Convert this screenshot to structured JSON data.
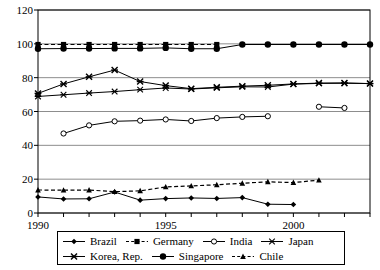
{
  "chart_data": {
    "type": "line",
    "title": "",
    "xlabel": "",
    "ylabel": "",
    "xlim": [
      1990,
      2003
    ],
    "ylim": [
      0,
      120
    ],
    "ytick_step": 20,
    "yticks": [
      0,
      20,
      40,
      60,
      80,
      100,
      120
    ],
    "xticks_labeled": [
      1990,
      1995,
      2000
    ],
    "xticks_all": [
      1990,
      1991,
      1992,
      1993,
      1994,
      1995,
      1996,
      1997,
      1998,
      1999,
      2000,
      2001,
      2002,
      2003
    ],
    "grid": "horizontal",
    "legend_position": "bottom",
    "series": [
      {
        "name": "Brazil",
        "marker": "diamond-filled",
        "line": "solid",
        "x": [
          1990,
          1991,
          1992,
          1993,
          1994,
          1995,
          1996,
          1997,
          1998,
          1999,
          2000
        ],
        "values": [
          9.5,
          8.3,
          8.4,
          12.4,
          7.6,
          8.5,
          8.9,
          8.6,
          9.1,
          5.2,
          5.0
        ]
      },
      {
        "name": "Germany",
        "marker": "square-filled",
        "line": "dashed",
        "x": [
          1990,
          1991,
          1992,
          1993,
          1994,
          1995,
          1996,
          1997
        ],
        "values": [
          99.6,
          99.6,
          99.6,
          99.6,
          99.6,
          99.6,
          99.6,
          99.6
        ]
      },
      {
        "name": "India",
        "marker": "circle-open",
        "line": "solid",
        "x": [
          1991,
          1992,
          1993,
          1994,
          1995,
          1996,
          1997,
          1998,
          1999,
          2001,
          2002
        ],
        "values": [
          47.0,
          51.8,
          54.2,
          54.6,
          55.3,
          54.4,
          56.1,
          56.8,
          57.2,
          62.8,
          62.1
        ]
      },
      {
        "name": "Japan",
        "marker": "x",
        "line": "solid",
        "x": [
          1990,
          1991,
          1992,
          1993,
          1994,
          1995,
          1996,
          1997,
          1998,
          1999,
          2000,
          2001,
          2002,
          2003
        ],
        "values": [
          68.9,
          69.9,
          70.9,
          71.8,
          72.9,
          73.9,
          73.3,
          74.0,
          74.6,
          74.5,
          76.2,
          76.6,
          76.7,
          76.5
        ]
      },
      {
        "name": "Korea, Rep.",
        "marker": "x-bold",
        "line": "solid",
        "x": [
          1990,
          1991,
          1992,
          1993,
          1994,
          1995,
          1996,
          1997,
          1998,
          1999,
          2000,
          2001,
          2002,
          2003
        ],
        "values": [
          70.7,
          76.3,
          80.5,
          84.5,
          77.7,
          75.3,
          73.5,
          74.3,
          75.0,
          75.5,
          76.3,
          76.8,
          76.9,
          76.5
        ]
      },
      {
        "name": "Singapore",
        "marker": "circle-filled",
        "line": "solid",
        "x": [
          1990,
          1991,
          1992,
          1993,
          1994,
          1995,
          1996,
          1997,
          1998,
          1999,
          2000,
          2001,
          2002,
          2003
        ],
        "values": [
          97.1,
          97.2,
          97.2,
          97.3,
          97.3,
          97.6,
          97.1,
          97.1,
          99.6,
          99.6,
          99.6,
          99.6,
          99.6,
          99.6
        ]
      },
      {
        "name": "Chile",
        "marker": "triangle-filled",
        "line": "dashed",
        "x": [
          1990,
          1991,
          1992,
          1993,
          1994,
          1995,
          1996,
          1997,
          1998,
          1999,
          2000,
          2001
        ],
        "values": [
          13.6,
          13.5,
          13.6,
          12.6,
          13.1,
          15.4,
          16.0,
          16.7,
          17.6,
          18.4,
          18.0,
          19.4
        ]
      }
    ]
  },
  "axes": {
    "y_tick_labels": [
      "0",
      "20",
      "40",
      "60",
      "80",
      "100",
      "120"
    ],
    "x_tick_labels": [
      "1990",
      "1995",
      "2000"
    ]
  },
  "legend": {
    "row1": [
      {
        "label": "Brazil",
        "marker": "diamond-filled",
        "line": "solid"
      },
      {
        "label": "Germany",
        "marker": "square-filled",
        "line": "dashed"
      },
      {
        "label": "India",
        "marker": "circle-open",
        "line": "solid"
      },
      {
        "label": "Japan",
        "marker": "x",
        "line": "solid"
      }
    ],
    "row2": [
      {
        "label": "Korea, Rep.",
        "marker": "x-bold",
        "line": "solid"
      },
      {
        "label": "Singapore",
        "marker": "circle-filled",
        "line": "solid"
      },
      {
        "label": "Chile",
        "marker": "triangle-filled",
        "line": "dashed"
      }
    ]
  },
  "colors": {
    "line": "#000000",
    "grid": "#808080",
    "axis": "#000000",
    "background": "#ffffff"
  }
}
